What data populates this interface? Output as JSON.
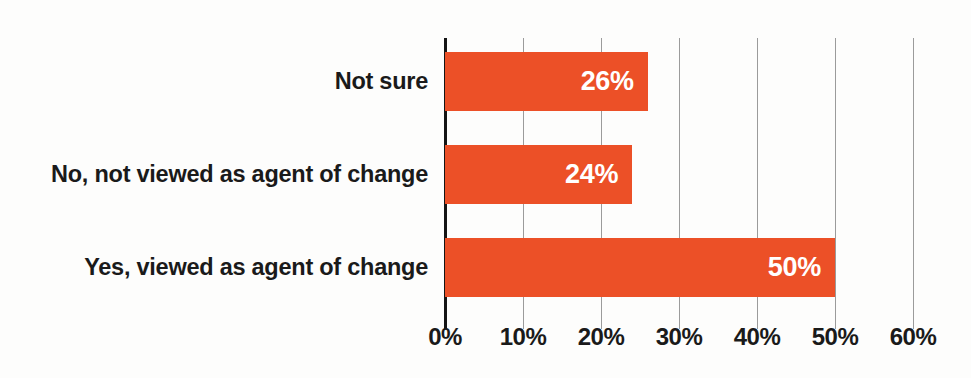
{
  "chart_data": {
    "type": "bar",
    "orientation": "horizontal",
    "title": "",
    "subtitle": "",
    "xlabel": "",
    "ylabel": "",
    "categories": [
      "Not sure",
      "No, not viewed as agent of change",
      "Yes, viewed as agent of change"
    ],
    "values": [
      26,
      24,
      50
    ],
    "data_labels": [
      "26%",
      "24%",
      "50%"
    ],
    "series": [
      {
        "name": "Share of respondents",
        "values": [
          26,
          24,
          50
        ]
      }
    ],
    "xlim": [
      0,
      60
    ],
    "xticks": [
      0,
      10,
      20,
      30,
      40,
      50,
      60
    ],
    "xtick_labels": [
      "0%",
      "10%",
      "20%",
      "30%",
      "40%",
      "50%",
      "60%"
    ],
    "grid": "vertical",
    "legend": "none",
    "bar_color": "#EC5027",
    "data_label_color": "#FFFFFF",
    "axis_color": "#151515",
    "gridline_color": "#9B9B9B",
    "background_color": "#FDFDFC",
    "text_color": "#1A1A1A"
  },
  "bars": [
    {
      "label": "Not sure",
      "value": 26,
      "value_text": "26%"
    },
    {
      "label": "No, not viewed as agent of change",
      "value": 24,
      "value_text": "24%"
    },
    {
      "label": "Yes, viewed as agent of change",
      "value": 50,
      "value_text": "50%"
    }
  ],
  "axis": {
    "ticks": [
      {
        "value": 0,
        "label": "0%"
      },
      {
        "value": 10,
        "label": "10%"
      },
      {
        "value": 20,
        "label": "20%"
      },
      {
        "value": 30,
        "label": "30%"
      },
      {
        "value": 40,
        "label": "40%"
      },
      {
        "value": 50,
        "label": "50%"
      },
      {
        "value": 60,
        "label": "60%"
      }
    ]
  }
}
